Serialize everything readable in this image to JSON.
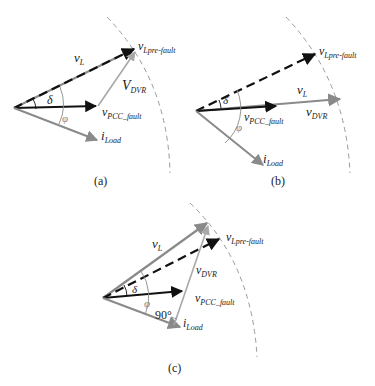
{
  "figure": {
    "panels": [
      {
        "id": "a",
        "caption": "(a)",
        "labels": {
          "vL": "v",
          "vL_sub": "L",
          "vLpre": "v",
          "vLpre_sub": "Lpre-fault",
          "vDVR": "V",
          "vDVR_sub": "DVR",
          "vPCC": "v",
          "vPCC_sub": "PCC_fault",
          "iLoad": "i",
          "iLoad_sub": "Load",
          "delta": "δ",
          "phi": "φ"
        }
      },
      {
        "id": "b",
        "caption": "(b)",
        "labels": {
          "vL": "v",
          "vL_sub": "L",
          "vLpre": "v",
          "vLpre_sub": "Lpre-fault",
          "vDVR": "v",
          "vDVR_sub": "DVR",
          "vPCC": "v",
          "vPCC_sub": "PCC_fault",
          "iLoad": "i",
          "iLoad_sub": "Load",
          "delta": "δ",
          "phi": "φ"
        }
      },
      {
        "id": "c",
        "caption": "(c)",
        "labels": {
          "vL": "v",
          "vL_sub": "L",
          "vLpre": "v",
          "vLpre_sub": "Lpre-fault",
          "vDVR": "v",
          "vDVR_sub": "DVR",
          "vPCC": "v",
          "vPCC_sub": "PCC_fault",
          "iLoad": "i",
          "iLoad_sub": "Load",
          "delta": "δ",
          "phi": "φ",
          "right_angle": "90°"
        }
      }
    ],
    "colors": {
      "black_vector": "#111111",
      "gray_vector": "#8a8a8a",
      "light_gray_vector": "#a8a8a8",
      "arc": "#9a9a9a"
    }
  }
}
